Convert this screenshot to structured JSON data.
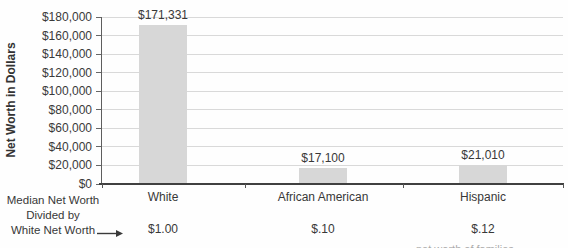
{
  "chart_data": {
    "type": "bar",
    "title": "",
    "ylabel": "Net Worth in Dollars",
    "xlabel": "",
    "categories": [
      "White",
      "African American",
      "Hispanic"
    ],
    "values": [
      171331,
      17100,
      21010
    ],
    "value_labels": [
      "$171,331",
      "$17,100",
      "$21,010"
    ],
    "y_ticks": [
      "$0",
      "$20,000",
      "$40,000",
      "$60,000",
      "$80,000",
      "$100,000",
      "$120,000",
      "$140,000",
      "$160,000",
      "$180,000"
    ],
    "ylim": [
      0,
      180000
    ],
    "grid": true,
    "legend": "none",
    "bar_color": "#d7d7d7",
    "ratio_row": {
      "label_lines": [
        "Median Net Worth",
        "Divided by",
        "White Net Worth"
      ],
      "values": [
        "$1.00",
        "$.10",
        "$.12"
      ]
    },
    "cutoff_fragment": "net worth of families"
  },
  "colors": {
    "bar": "#d7d7d7",
    "gridline": "#d9d9d9",
    "axis": "#404040",
    "text": "#3a3a3a"
  }
}
